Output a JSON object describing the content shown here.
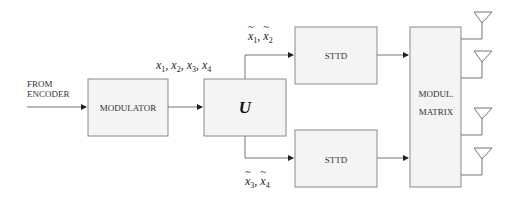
{
  "diagram": {
    "input_label_line1": "FROM",
    "input_label_line2": "ENCODER",
    "blocks": {
      "modulator": "MODULATOR",
      "unitary": "U",
      "sttd_top": "STTD",
      "sttd_bottom": "STTD",
      "matrix_line1": "MODUL.",
      "matrix_line2": "MATRIX"
    },
    "signals": {
      "modulator_output": {
        "symbol": "x",
        "indices": [
          "1",
          "2",
          "3",
          "4"
        ]
      },
      "top_branch": {
        "symbol": "x",
        "indices": [
          "1",
          "2"
        ],
        "tilde": true
      },
      "bottom_branch": {
        "symbol": "x",
        "indices": [
          "3",
          "4"
        ],
        "tilde": true
      }
    },
    "antenna_count": 4,
    "colors": {
      "box_fill": "#f4f4f4",
      "box_stroke": "#8a8a8a",
      "line": "#777777"
    }
  }
}
